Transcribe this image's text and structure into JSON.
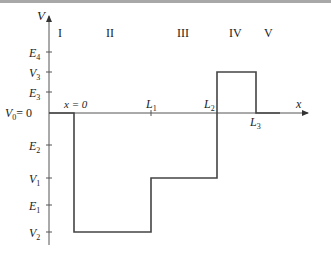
{
  "diagram": {
    "axes": {
      "y_label": "V",
      "x_label": "x",
      "origin_label": "x = 0"
    },
    "regions": [
      {
        "label": "I",
        "x": 60
      },
      {
        "label": "II",
        "x": 112
      },
      {
        "label": "III",
        "x": 184
      },
      {
        "label": "IV",
        "x": 236
      },
      {
        "label": "V",
        "x": 268
      }
    ],
    "y_ticks": [
      {
        "label": "E",
        "sub": "4",
        "y": 52
      },
      {
        "label": "V",
        "sub": "3",
        "y": 72
      },
      {
        "label": "E",
        "sub": "3",
        "y": 92
      },
      {
        "label": "V",
        "sub": "0",
        "suffix": "= 0",
        "y": 113
      },
      {
        "label": "E",
        "sub": "2",
        "y": 145
      },
      {
        "label": "V",
        "sub": "1",
        "y": 178
      },
      {
        "label": "E",
        "sub": "1",
        "y": 205
      },
      {
        "label": "V",
        "sub": "2",
        "y": 232
      }
    ],
    "x_markers": [
      {
        "label": "L",
        "sub": "1",
        "x": 151
      },
      {
        "label": "L",
        "sub": "2",
        "x": 217
      },
      {
        "label": "L",
        "sub": "3",
        "x": 256
      }
    ],
    "potential_segments": [
      {
        "region": "I",
        "from": "x<0",
        "value": "V0 = 0"
      },
      {
        "region": "II",
        "from": "0",
        "to": "L1",
        "value": "V2"
      },
      {
        "region": "III",
        "from": "L1",
        "to": "L2",
        "value": "V1"
      },
      {
        "region": "IV",
        "from": "L2",
        "to": "L3",
        "value": "V3"
      },
      {
        "region": "V",
        "from": "L3",
        "value": "V0 = 0"
      }
    ],
    "colors": {
      "line": "#444444",
      "axis": "#555555",
      "text": "#222222",
      "topbar": "#a8a8a8"
    }
  }
}
